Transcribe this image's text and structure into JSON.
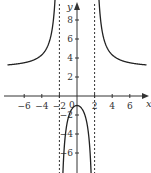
{
  "chart_data": {
    "type": "line",
    "title": "",
    "xlabel": "x",
    "ylabel": "y",
    "xlim": [
      -8,
      8
    ],
    "ylim": [
      -8,
      9.5
    ],
    "grid": false,
    "x_ticks": [
      -6,
      -4,
      -2,
      2,
      4,
      6
    ],
    "y_ticks": [
      8,
      6,
      4,
      2,
      -2,
      -4,
      -6
    ],
    "x_tick_labels": [
      "−6",
      "−4",
      "−2",
      "2",
      "4",
      "6"
    ],
    "y_tick_labels": [
      "8",
      "6",
      "4",
      "2",
      "−2",
      "−4",
      "−6"
    ],
    "origin_label": "0",
    "vertical_asymptotes": [
      -2,
      2
    ],
    "horizontal_asymptote_approx": 3,
    "series": [
      {
        "name": "f(x) approx (3x²+4)/(x²−4)",
        "x": [
          -7.5,
          -6,
          -4,
          -3,
          -2.5,
          -2.2
        ],
        "y": [
          3.4,
          3.5,
          4.3,
          6.2,
          10.3,
          17.5
        ]
      },
      {
        "name": "middle branch",
        "x": [
          -1.8,
          -1.5,
          -1,
          0,
          1,
          1.5,
          1.8
        ],
        "y": [
          -7.6,
          -4.3,
          -2.3,
          -1,
          -2.3,
          -4.3,
          -7.6
        ]
      },
      {
        "name": "right branch",
        "x": [
          2.2,
          2.5,
          3,
          4,
          6,
          7.5
        ],
        "y": [
          17.5,
          10.3,
          6.2,
          4.3,
          3.5,
          3.4
        ]
      }
    ]
  }
}
